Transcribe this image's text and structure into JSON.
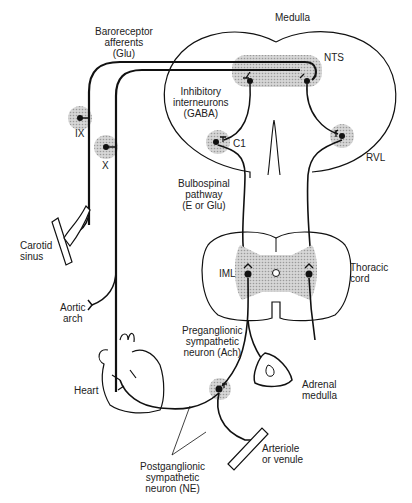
{
  "diagram": {
    "type": "neural-pathway",
    "colors": {
      "line": "#111111",
      "shade": "#c8c8c8",
      "background": "#ffffff"
    },
    "labels": {
      "medulla": "Medulla",
      "nts": "NTS",
      "baroreceptor": [
        "Baroreceptor",
        "afferents",
        "(Glu)"
      ],
      "inhibitory": [
        "Inhibitory",
        "interneurons",
        "(GABA)"
      ],
      "c1": "C1",
      "rvl": "RVL",
      "ix": "IX",
      "x": "X",
      "bulbospinal": [
        "Bulbospinal",
        "pathway",
        "(E or Glu)"
      ],
      "carotid": [
        "Carotid",
        "sinus"
      ],
      "aortic": [
        "Aortic",
        "arch"
      ],
      "iml": "IML",
      "thoracic": [
        "Thoracic",
        "cord"
      ],
      "preganglionic": [
        "Preganglionic",
        "sympathetic",
        "neuron (Ach)"
      ],
      "adrenal": [
        "Adrenal",
        "medulla"
      ],
      "heart": "Heart",
      "postganglionic": [
        "Postganglionic",
        "sympathetic",
        "neuron (NE)"
      ],
      "arteriole": [
        "Arteriole",
        "or venule"
      ]
    }
  }
}
